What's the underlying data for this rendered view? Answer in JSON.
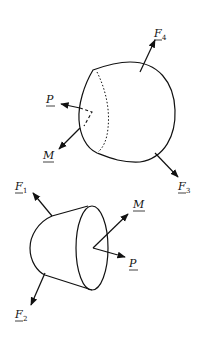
{
  "diagram": {
    "type": "free-body-diagram",
    "colors": {
      "ink": "#111111",
      "background": "#ffffff"
    },
    "top_body": {
      "forces": [
        {
          "id": "F4",
          "letter": "F",
          "sub": "4"
        },
        {
          "id": "F3",
          "letter": "F",
          "sub": "3"
        }
      ],
      "internal": [
        {
          "id": "P",
          "letter": "P",
          "sub": ""
        },
        {
          "id": "M",
          "letter": "M",
          "sub": ""
        }
      ]
    },
    "bottom_body": {
      "forces": [
        {
          "id": "F1",
          "letter": "F",
          "sub": "1"
        },
        {
          "id": "F2",
          "letter": "F",
          "sub": "2"
        }
      ],
      "internal": [
        {
          "id": "M",
          "letter": "M",
          "sub": ""
        },
        {
          "id": "P",
          "letter": "P",
          "sub": ""
        }
      ]
    }
  }
}
